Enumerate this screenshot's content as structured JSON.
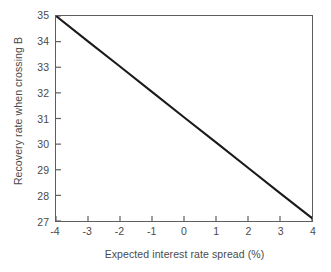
{
  "chart_data": {
    "type": "line",
    "title": "",
    "xlabel": "Expected interest rate spread (%)",
    "ylabel": "Recovery rate when crossing B",
    "xlim": [
      -4,
      4
    ],
    "ylim": [
      27,
      35
    ],
    "xticks": [
      "-4",
      "-3",
      "-2",
      "-1",
      "0",
      "1",
      "2",
      "3",
      "4"
    ],
    "xtick_values": [
      -4,
      -3,
      -2,
      -1,
      0,
      1,
      2,
      3,
      4
    ],
    "yticks": [
      "27",
      "28",
      "29",
      "30",
      "31",
      "32",
      "33",
      "34",
      "35"
    ],
    "ytick_values": [
      27,
      28,
      29,
      30,
      31,
      32,
      33,
      34,
      35
    ],
    "grid": false,
    "legend": "none",
    "line_color": "#1a1a1a",
    "frame_color": "#5d5d5d",
    "background_color": "#ffffff",
    "series": [
      {
        "name": "Recovery rate when crossing B",
        "x": [
          -4,
          -3,
          -2,
          -1,
          0,
          1,
          2,
          3,
          4
        ],
        "values": [
          35.0,
          34.01,
          33.03,
          32.04,
          31.05,
          30.07,
          29.08,
          28.09,
          27.11
        ]
      }
    ]
  }
}
